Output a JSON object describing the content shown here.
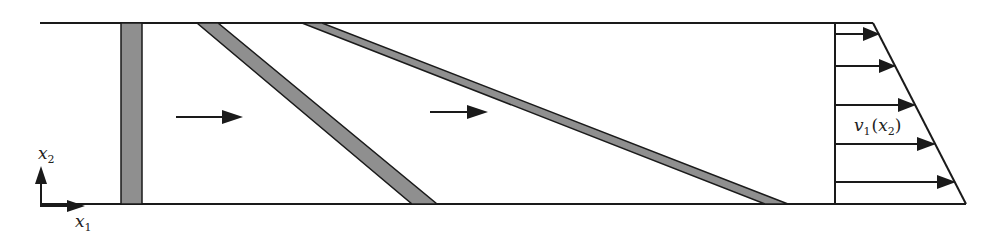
{
  "diagram": {
    "colors": {
      "line": "#1a1a1a",
      "band_fill": "#8f8f8f",
      "background": "#ffffff"
    },
    "axes": {
      "x_label": "x",
      "x_subscript": "1",
      "y_label": "x",
      "y_subscript": "2"
    },
    "flow_arrows": [
      {
        "id": "flow-arrow-1",
        "label": ""
      },
      {
        "id": "flow-arrow-2",
        "label": ""
      }
    ],
    "bands": [
      {
        "id": "band-initial",
        "description": "vertical band (initial)"
      },
      {
        "id": "band-sheared-1",
        "description": "inclined band (sheared)"
      },
      {
        "id": "band-sheared-2",
        "description": "inclined band (further sheared)"
      }
    ],
    "velocity_profile": {
      "label_v": "v",
      "label_v_sub": "1",
      "label_open": "(",
      "label_arg": "x",
      "label_arg_sub": "2",
      "label_close": ")",
      "arrow_count": 5
    }
  }
}
